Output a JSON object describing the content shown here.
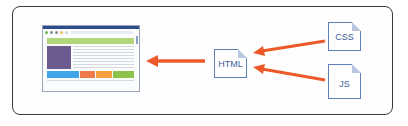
{
  "diagram": {
    "nodes": {
      "browser": {
        "label": "Browser window",
        "colors": {
          "titlebar": "#2e4d8c",
          "banner": "#b2d67a",
          "sidebar": "#6b5b8f",
          "cells": [
            "#3fa5e6",
            "#ee7a4a",
            "#f5a03c",
            "#8cc34b"
          ]
        }
      },
      "html": {
        "label": "HTML"
      },
      "css": {
        "label": "CSS"
      },
      "js": {
        "label": "JS"
      }
    },
    "edges": [
      {
        "from": "css",
        "to": "html"
      },
      {
        "from": "js",
        "to": "html"
      },
      {
        "from": "html",
        "to": "browser"
      }
    ],
    "colors": {
      "arrow": "#ec5a2a",
      "doc_border": "#5f7fb8",
      "doc_text": "#3d5d9a",
      "frame": "#3a3a3a"
    }
  }
}
